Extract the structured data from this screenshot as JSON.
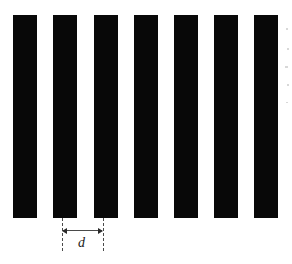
{
  "figure": {
    "name": "diffraction-grating-diagram",
    "background_color": "#ffffff",
    "bar_color": "#080808",
    "annotation_color": "#4a4a4a",
    "width": 292,
    "height": 264
  },
  "grating": {
    "bar_count": 7,
    "bar_width": 24,
    "gap_width": 16,
    "period": 40,
    "bar_top": 15,
    "bar_bottom": 218,
    "bar_height": 203,
    "bars": [
      {
        "index": 1,
        "x": 13,
        "y": 15,
        "width": 24,
        "height": 203
      },
      {
        "index": 2,
        "x": 53,
        "y": 15,
        "width": 24,
        "height": 203
      },
      {
        "index": 3,
        "x": 94,
        "y": 15,
        "width": 24,
        "height": 203
      },
      {
        "index": 4,
        "x": 134,
        "y": 15,
        "width": 24,
        "height": 203
      },
      {
        "index": 5,
        "x": 174,
        "y": 15,
        "width": 24,
        "height": 203
      },
      {
        "index": 6,
        "x": 214,
        "y": 15,
        "width": 24,
        "height": 203
      },
      {
        "index": 7,
        "x": 254,
        "y": 15,
        "width": 24,
        "height": 203
      }
    ]
  },
  "dimension": {
    "label": "d",
    "meaning": "grating-period",
    "line_y": 230,
    "left_x": 62,
    "right_x": 103,
    "span": 41,
    "extension_top": 218,
    "extension_bottom": 251,
    "label_x": 78,
    "label_y": 236
  },
  "artifacts": [
    {
      "x": 286,
      "y": 28,
      "width": 2,
      "height": 2
    },
    {
      "x": 287,
      "y": 48,
      "width": 2,
      "height": 2
    },
    {
      "x": 285,
      "y": 66,
      "width": 3,
      "height": 2
    },
    {
      "x": 287,
      "y": 84,
      "width": 2,
      "height": 2
    },
    {
      "x": 286,
      "y": 102,
      "width": 2,
      "height": 1
    }
  ]
}
